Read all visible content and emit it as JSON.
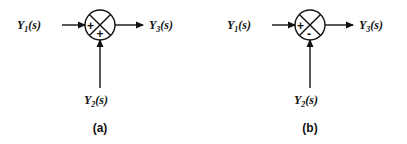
{
  "diagrams": [
    {
      "caption": "(a)",
      "input_left": {
        "name": "Y",
        "sub": "1",
        "arg": "(s)"
      },
      "input_bottom": {
        "name": "Y",
        "sub": "2",
        "arg": "(s)"
      },
      "output": {
        "name": "Y",
        "sub": "3",
        "arg": "(s)"
      },
      "sign_left": "+",
      "sign_bottom": "+"
    },
    {
      "caption": "(b)",
      "input_left": {
        "name": "Y",
        "sub": "1",
        "arg": "(s)"
      },
      "input_bottom": {
        "name": "Y",
        "sub": "2",
        "arg": "(s)"
      },
      "output": {
        "name": "Y",
        "sub": "3",
        "arg": "(s)"
      },
      "sign_left": "+",
      "sign_bottom": "-"
    }
  ],
  "colors": {
    "stroke": "#111111",
    "background": "#ffffff"
  }
}
